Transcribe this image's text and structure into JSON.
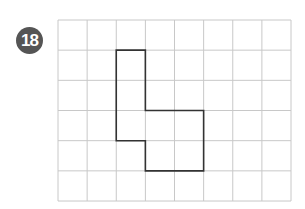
{
  "problem": {
    "number": "18"
  },
  "grid": {
    "columns": 8,
    "rows": 6,
    "origin_x": 58,
    "origin_y": 20,
    "cell_width": 29.125,
    "cell_height": 30.17,
    "line_color": "#c8c8c8",
    "shape_color": "#333333"
  },
  "shape": {
    "vertices": [
      [
        2,
        1
      ],
      [
        3,
        1
      ],
      [
        3,
        3
      ],
      [
        5,
        3
      ],
      [
        5,
        5
      ],
      [
        3,
        5
      ],
      [
        3,
        4
      ],
      [
        2,
        4
      ]
    ]
  }
}
